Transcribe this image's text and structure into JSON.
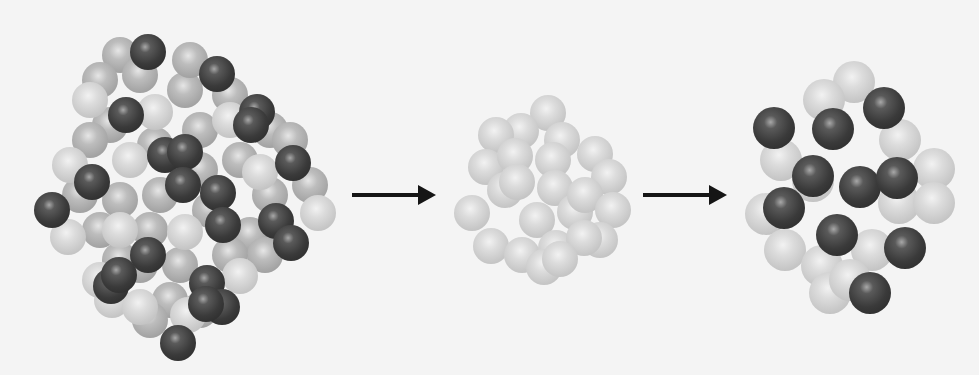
{
  "diagram": {
    "colors": {
      "background": "#f4f4f4",
      "light_atom": "#d0d0d0",
      "mid_atom": "#a8a8a8",
      "dark_atom": "#3a3a3a",
      "arrow": "#151515"
    },
    "arrows": [
      {
        "x": 352,
        "y": 193,
        "length": 70
      },
      {
        "x": 643,
        "y": 193,
        "length": 70
      }
    ],
    "clusters": [
      {
        "name": "mixed-cluster",
        "radius": 18,
        "light": [
          [
            90,
            100
          ],
          [
            70,
            165
          ],
          [
            68,
            237
          ],
          [
            130,
            160
          ],
          [
            120,
            230
          ],
          [
            112,
            300
          ],
          [
            140,
            307
          ],
          [
            185,
            232
          ],
          [
            260,
            172
          ],
          [
            240,
            276
          ],
          [
            318,
            213
          ],
          [
            230,
            120
          ],
          [
            155,
            112
          ],
          [
            100,
            280
          ],
          [
            188,
            315
          ]
        ],
        "mid": [
          [
            120,
            55
          ],
          [
            100,
            80
          ],
          [
            140,
            75
          ],
          [
            185,
            90
          ],
          [
            190,
            60
          ],
          [
            230,
            95
          ],
          [
            110,
            125
          ],
          [
            90,
            140
          ],
          [
            155,
            145
          ],
          [
            200,
            130
          ],
          [
            270,
            130
          ],
          [
            290,
            140
          ],
          [
            80,
            195
          ],
          [
            120,
            200
          ],
          [
            160,
            195
          ],
          [
            200,
            170
          ],
          [
            240,
            160
          ],
          [
            270,
            195
          ],
          [
            310,
            185
          ],
          [
            100,
            230
          ],
          [
            150,
            230
          ],
          [
            210,
            210
          ],
          [
            250,
            235
          ],
          [
            140,
            265
          ],
          [
            180,
            265
          ],
          [
            265,
            255
          ],
          [
            170,
            300
          ],
          [
            200,
            310
          ],
          [
            150,
            320
          ],
          [
            120,
            260
          ],
          [
            230,
            255
          ]
        ],
        "dark": [
          [
            148,
            52
          ],
          [
            217,
            74
          ],
          [
            126,
            115
          ],
          [
            257,
            112
          ],
          [
            251,
            125
          ],
          [
            165,
            155
          ],
          [
            185,
            152
          ],
          [
            293,
            163
          ],
          [
            92,
            182
          ],
          [
            183,
            185
          ],
          [
            52,
            210
          ],
          [
            218,
            193
          ],
          [
            223,
            225
          ],
          [
            276,
            221
          ],
          [
            291,
            243
          ],
          [
            148,
            255
          ],
          [
            207,
            283
          ],
          [
            111,
            286
          ],
          [
            119,
            275
          ],
          [
            222,
            307
          ],
          [
            206,
            304
          ],
          [
            178,
            343
          ]
        ]
      },
      {
        "name": "pure-cluster",
        "radius": 18,
        "light": [
          [
            548,
            113
          ],
          [
            521,
            131
          ],
          [
            562,
            140
          ],
          [
            496,
            135
          ],
          [
            486,
            167
          ],
          [
            515,
            156
          ],
          [
            553,
            160
          ],
          [
            595,
            154
          ],
          [
            609,
            177
          ],
          [
            505,
            190
          ],
          [
            517,
            182
          ],
          [
            555,
            188
          ],
          [
            575,
            212
          ],
          [
            585,
            195
          ],
          [
            613,
            210
          ],
          [
            472,
            213
          ],
          [
            537,
            220
          ],
          [
            600,
            240
          ],
          [
            491,
            246
          ],
          [
            522,
            255
          ],
          [
            556,
            248
          ],
          [
            584,
            238
          ],
          [
            544,
            267
          ],
          [
            560,
            259
          ]
        ]
      },
      {
        "name": "decorated-cluster",
        "radius": 21,
        "light": [
          [
            854,
            82
          ],
          [
            824,
            100
          ],
          [
            900,
            140
          ],
          [
            781,
            160
          ],
          [
            934,
            169
          ],
          [
            813,
            181
          ],
          [
            899,
            203
          ],
          [
            766,
            214
          ],
          [
            934,
            203
          ],
          [
            785,
            250
          ],
          [
            822,
            266
          ],
          [
            872,
            250
          ],
          [
            830,
            293
          ],
          [
            850,
            280
          ]
        ],
        "dark": [
          [
            774,
            128
          ],
          [
            833,
            129
          ],
          [
            884,
            108
          ],
          [
            813,
            176
          ],
          [
            860,
            187
          ],
          [
            897,
            178
          ],
          [
            784,
            208
          ],
          [
            837,
            235
          ],
          [
            905,
            248
          ],
          [
            870,
            293
          ]
        ]
      }
    ]
  }
}
